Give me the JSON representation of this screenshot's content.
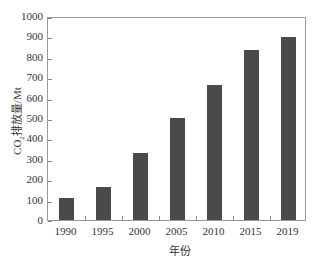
{
  "chart_data": {
    "type": "bar",
    "title": "",
    "xlabel": "年份",
    "ylabel": "CO2排放量/Mt",
    "ylabel_display": {
      "prefix": "CO",
      "subscript": "2",
      "suffix": "排放量/Mt"
    },
    "categories": [
      "1990",
      "1995",
      "2000",
      "2005",
      "2010",
      "2015",
      "2019"
    ],
    "values": [
      107,
      160,
      328,
      502,
      662,
      833,
      898
    ],
    "ylim": [
      0,
      1000
    ],
    "yticks": [
      0,
      100,
      200,
      300,
      400,
      500,
      600,
      700,
      800,
      900,
      1000
    ],
    "grid": false,
    "legend": null,
    "bar_color": "#4a4a4a"
  }
}
